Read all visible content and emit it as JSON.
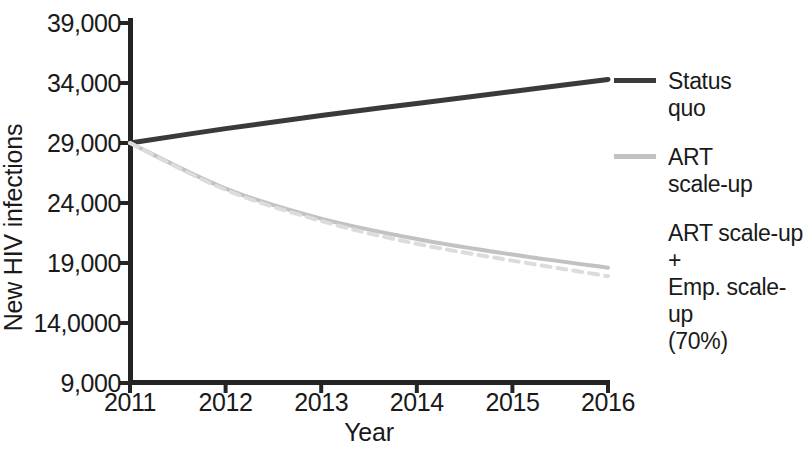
{
  "chart_data": {
    "type": "line",
    "title": "",
    "xlabel": "Year",
    "ylabel": "New HIV infections",
    "x": [
      2011,
      2012,
      2013,
      2014,
      2015,
      2016
    ],
    "xlim": [
      2011,
      2016
    ],
    "ylim": [
      9000,
      39000
    ],
    "grid": false,
    "legend_position": "right",
    "y_ticks": [
      "9,000",
      "14,0000",
      "19,000",
      "24,000",
      "29,000",
      "34,000",
      "39,000"
    ],
    "y_tick_values": [
      9000,
      14000,
      19000,
      24000,
      29000,
      34000,
      39000
    ],
    "x_ticks": [
      "2011",
      "2012",
      "2013",
      "2014",
      "2015",
      "2016"
    ],
    "series": [
      {
        "name": "Status quo",
        "legend_label": "Status\nquo",
        "color": "#3a3a3a",
        "style": "solid",
        "width": 5,
        "values": [
          29000,
          30200,
          31300,
          32300,
          33300,
          34300
        ]
      },
      {
        "name": "ART scale-up",
        "legend_label": "ART\nscale-up",
        "color": "#c2c2c2",
        "style": "solid",
        "width": 4,
        "values": [
          29000,
          25200,
          22700,
          21000,
          19700,
          18600
        ]
      },
      {
        "name": "ART scale-up + Emp. scale-up (70%)",
        "legend_label": "ART scale-up +\nEmp. scale-up\n(70%)",
        "color": "#dcdcdc",
        "style": "dashed",
        "width": 4,
        "values": [
          29000,
          25100,
          22500,
          20600,
          19200,
          17900
        ]
      }
    ]
  }
}
